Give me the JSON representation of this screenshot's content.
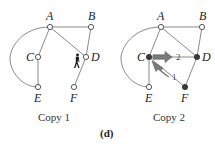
{
  "figure": {
    "label": "(d)",
    "colors": {
      "edge": "#8a8a8a",
      "open_node": "#ffffff",
      "filled_node": "#3a3a3a",
      "arrow": "#7a7a7a"
    }
  },
  "copy1": {
    "caption": "Copy 1",
    "nodes": [
      {
        "id": "A",
        "label": "A",
        "state": "open"
      },
      {
        "id": "B",
        "label": "B",
        "state": "open"
      },
      {
        "id": "C",
        "label": "C",
        "state": "open"
      },
      {
        "id": "D",
        "label": "D",
        "state": "open"
      },
      {
        "id": "E",
        "label": "E",
        "state": "open"
      },
      {
        "id": "F",
        "label": "F",
        "state": "open"
      }
    ],
    "edges": [
      [
        "A",
        "B"
      ],
      [
        "A",
        "C"
      ],
      [
        "A",
        "D"
      ],
      [
        "B",
        "D"
      ],
      [
        "C",
        "E"
      ],
      [
        "D",
        "F"
      ],
      [
        "A",
        "E",
        "arc"
      ]
    ],
    "walker_icon": "walking-person-icon",
    "walker_near": "D"
  },
  "copy2": {
    "caption": "Copy 2",
    "nodes": [
      {
        "id": "A",
        "label": "A",
        "state": "open"
      },
      {
        "id": "B",
        "label": "B",
        "state": "open"
      },
      {
        "id": "C",
        "label": "C",
        "state": "filled"
      },
      {
        "id": "D",
        "label": "D",
        "state": "filled"
      },
      {
        "id": "E",
        "label": "E",
        "state": "open"
      },
      {
        "id": "F",
        "label": "F",
        "state": "filled"
      }
    ],
    "edges": [
      [
        "A",
        "B"
      ],
      [
        "A",
        "C"
      ],
      [
        "A",
        "D"
      ],
      [
        "B",
        "D"
      ],
      [
        "C",
        "E"
      ],
      [
        "C",
        "D"
      ],
      [
        "C",
        "F"
      ],
      [
        "D",
        "F"
      ],
      [
        "A",
        "E",
        "arc"
      ]
    ],
    "arrows": [
      {
        "from": "F",
        "to": "C",
        "label": "1"
      },
      {
        "from": "C",
        "to": "D",
        "label": "2"
      }
    ]
  }
}
